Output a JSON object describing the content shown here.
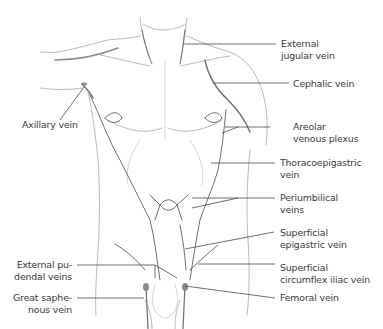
{
  "figure": {
    "colors": {
      "background": "#ffffff",
      "outline": "#9a9a9a",
      "vein": "#6e6e6e",
      "leader_line": "#4a4a4a",
      "label_text": "#3a3a3a"
    }
  },
  "labels": {
    "external_jugular": {
      "line1": "External",
      "line2": "jugular vein"
    },
    "cephalic": {
      "line1": "Cephalic vein"
    },
    "axillary": {
      "line1": "Axillary vein"
    },
    "areolar": {
      "line1": "Areolar",
      "line2": "venous plexus"
    },
    "thoracoepigastric": {
      "line1": "Thoracoepigastric",
      "line2": "vein"
    },
    "periumbilical": {
      "line1": "Periumbilical",
      "line2": "veins"
    },
    "superficial_epigastric": {
      "line1": "Superficial",
      "line2": "epigastric vein"
    },
    "superficial_circumflex_iliac": {
      "line1": "Superficial",
      "line2": "circumflex iliac vein"
    },
    "femoral": {
      "line1": "Femoral vein"
    },
    "external_pudendal": {
      "line1": "External pu-",
      "line2": "dendal veins"
    },
    "great_saphenous": {
      "line1": "Great saphe-",
      "line2": "nous vein"
    }
  }
}
